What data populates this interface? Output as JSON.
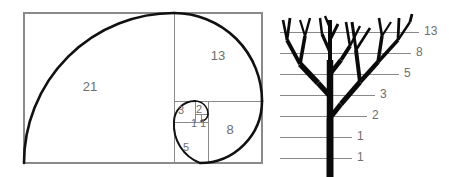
{
  "figure": {
    "background_color": "#ffffff",
    "label_color": "#6e6e6e",
    "line_color": "#8a8a8a",
    "stroke_color": "#111111"
  },
  "golden_rectangle": {
    "name": "fibonacci-golden-rectangle",
    "outer_border_color": "#8a8a8a",
    "spiral_color": "#111111",
    "squares": [
      {
        "label": "21",
        "value": 21,
        "x": 24,
        "y": 13,
        "size": 150,
        "label_x": 90,
        "label_y": 88
      },
      {
        "label": "13",
        "value": 13,
        "x": 174,
        "y": 13,
        "size": 88,
        "label_x": 218,
        "label_y": 57
      },
      {
        "label": "8",
        "value": 8,
        "x": 196,
        "y": 101,
        "size": 62,
        "label_x": 228,
        "label_y": 130
      },
      {
        "label": "5",
        "value": 5,
        "x": 174,
        "y": 122,
        "size": 34,
        "label_x": 186,
        "label_y": 147
      },
      {
        "label": "3",
        "value": 3,
        "x": 174,
        "y": 101,
        "size": 21,
        "label_x": 180,
        "label_y": 111
      },
      {
        "label": "2",
        "value": 2,
        "x": 190,
        "y": 101,
        "size": 13,
        "label_x": 196,
        "label_y": 110
      },
      {
        "label": "1",
        "value": 1,
        "x": 190,
        "y": 114,
        "size": 8,
        "label_x": 193,
        "label_y": 120
      },
      {
        "label": "1",
        "value": 1,
        "x": 198,
        "y": 114,
        "size": 8,
        "label_x": 201,
        "label_y": 120
      }
    ],
    "sequence": [
      1,
      1,
      2,
      3,
      5,
      8,
      13,
      21
    ]
  },
  "fibonacci_tree": {
    "name": "fibonacci-branching-tree",
    "trunk_color": "#0a0a0a",
    "gridline_color": "#7c7c7c",
    "levels": [
      {
        "label": "1",
        "value": 1,
        "y": 158,
        "line_x1": 280,
        "line_x2": 352,
        "label_x": 357
      },
      {
        "label": "1",
        "value": 1,
        "y": 137,
        "line_x1": 280,
        "line_x2": 352,
        "label_x": 357
      },
      {
        "label": "2",
        "value": 2,
        "y": 116,
        "line_x1": 280,
        "line_x2": 367,
        "label_x": 372
      },
      {
        "label": "3",
        "value": 3,
        "y": 95,
        "line_x1": 280,
        "line_x2": 375,
        "label_x": 380
      },
      {
        "label": "5",
        "value": 5,
        "y": 74,
        "line_x1": 280,
        "line_x2": 399,
        "label_x": 404
      },
      {
        "label": "8",
        "value": 8,
        "y": 53,
        "line_x1": 280,
        "line_x2": 411,
        "label_x": 416
      },
      {
        "label": "13",
        "value": 13,
        "y": 32,
        "line_x1": 280,
        "line_x2": 419,
        "label_x": 424
      }
    ],
    "sequence": [
      1,
      1,
      2,
      3,
      5,
      8,
      13
    ]
  }
}
